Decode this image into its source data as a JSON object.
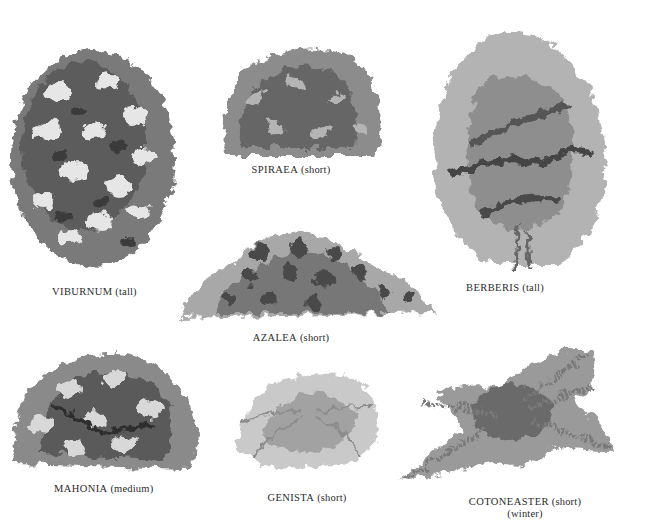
{
  "plate": {
    "background": "#ffffff",
    "ink": "#2b2b2b"
  },
  "plants": [
    {
      "name": "VIBURNUM",
      "size": "(tall)",
      "note": ""
    },
    {
      "name": "SPIRAEA",
      "size": "(short)",
      "note": ""
    },
    {
      "name": "BERBERIS",
      "size": "(tall)",
      "note": ""
    },
    {
      "name": "AZALEA",
      "size": "(short)",
      "note": ""
    },
    {
      "name": "MAHONIA",
      "size": "(medium)",
      "note": ""
    },
    {
      "name": "GENISTA",
      "size": "(short)",
      "note": ""
    },
    {
      "name": "COTONEASTER",
      "size": "(short)",
      "note": "(winter)"
    }
  ]
}
